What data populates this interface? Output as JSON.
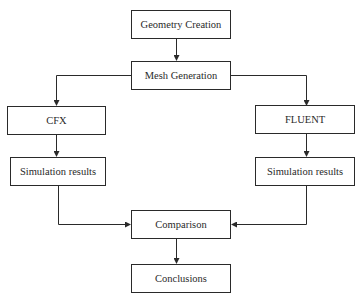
{
  "diagram": {
    "type": "flowchart",
    "colors": {
      "stroke": "#2a2a2a",
      "background": "#ffffff",
      "text": "#2a2a2a"
    },
    "nodes": [
      {
        "id": "geometry",
        "label": "Geometry Creation"
      },
      {
        "id": "mesh",
        "label": "Mesh Generation"
      },
      {
        "id": "cfx",
        "label": "CFX"
      },
      {
        "id": "fluent",
        "label": "FLUENT"
      },
      {
        "id": "sim_cfx",
        "label": "Simulation results"
      },
      {
        "id": "sim_fluent",
        "label": "Simulation results"
      },
      {
        "id": "comparison",
        "label": "Comparison"
      },
      {
        "id": "conclusions",
        "label": "Conclusions"
      }
    ],
    "edges": [
      {
        "from": "geometry",
        "to": "mesh"
      },
      {
        "from": "mesh",
        "to": "cfx"
      },
      {
        "from": "mesh",
        "to": "fluent"
      },
      {
        "from": "cfx",
        "to": "sim_cfx"
      },
      {
        "from": "fluent",
        "to": "sim_fluent"
      },
      {
        "from": "sim_cfx",
        "to": "comparison"
      },
      {
        "from": "sim_fluent",
        "to": "comparison"
      },
      {
        "from": "comparison",
        "to": "conclusions"
      }
    ]
  }
}
